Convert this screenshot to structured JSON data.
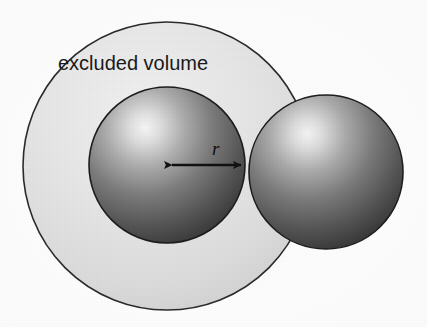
{
  "figure": {
    "background_color": "#fdfdfd",
    "labels": {
      "excluded_volume": "excluded volume",
      "radius_symbol": "r"
    },
    "colors": {
      "excluded_volume_fill_light": "#ebebeb",
      "excluded_volume_fill_dark": "#d2d2d2",
      "excluded_volume_stroke": "#2b2b2b",
      "sphere_highlight": "#f2f2f2",
      "sphere_mid": "#8d8d8d",
      "sphere_shadow": "#3a3a3a",
      "sphere_stroke": "#1d1d1d",
      "arrow_color": "#111111",
      "text_color": "#1a1a1a"
    },
    "geometry": {
      "excluded_volume_circle": {
        "cx": 167,
        "cy": 166,
        "r": 144
      },
      "left_sphere": {
        "cx": 167,
        "cy": 165,
        "r": 78
      },
      "right_sphere": {
        "cx": 326,
        "cy": 172,
        "r": 77
      },
      "radius_arrow": {
        "x1": 167,
        "y1": 165,
        "x2": 246,
        "y2": 165
      }
    },
    "label_positions": {
      "excluded_volume": {
        "x": 58,
        "y": 70,
        "font_size": 20
      },
      "radius_symbol": {
        "x": 212,
        "y": 155,
        "font_size": 19
      }
    }
  }
}
